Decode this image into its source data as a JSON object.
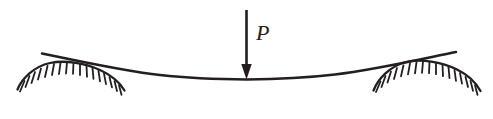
{
  "figure": {
    "kind": "engineering-sketch",
    "width": 493,
    "height": 119,
    "background_color": "#ffffff",
    "ink_color": "#231f20"
  },
  "load": {
    "label": "P",
    "label_x": 256,
    "label_y": 26,
    "arrow": {
      "x": 246.5,
      "y_top": 10,
      "y_tip": 79,
      "shaft_width": 2.6,
      "head_half_width": 5.2,
      "head_height": 15
    }
  },
  "beam": {
    "label": "beam",
    "left_tip_x": 42,
    "left_tip_y": 53.5,
    "right_tip_x": 456,
    "right_tip_y": 52,
    "mid_x": 247,
    "mid_y": 79,
    "stroke_width": 2.4
  },
  "supports": [
    {
      "name": "left-support",
      "side": "left",
      "x_left": 17,
      "x_right": 124,
      "apex_x": 66,
      "apex_y": 62,
      "base_y": 89,
      "hatch_count": 17,
      "hatch_length": 11,
      "hatch_angle_deg": 62
    },
    {
      "name": "right-support",
      "side": "right",
      "x_left": 373,
      "x_right": 480,
      "apex_x": 428,
      "apex_y": 61,
      "base_y": 90,
      "hatch_count": 17,
      "hatch_length": 11,
      "hatch_angle_deg": 62
    }
  ]
}
